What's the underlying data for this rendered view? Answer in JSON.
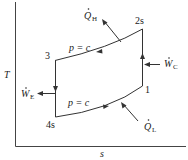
{
  "diagram": {
    "type": "T-s diagram (Brayton / gas refrigeration cycle)",
    "axes": {
      "y_label": "T",
      "x_label": "s"
    },
    "states": [
      {
        "id": "1",
        "label": "1"
      },
      {
        "id": "2s",
        "label": "2s"
      },
      {
        "id": "3",
        "label": "3"
      },
      {
        "id": "4s",
        "label": "4s"
      }
    ],
    "processes": [
      {
        "from": "1",
        "to": "2s",
        "type": "isentropic compression",
        "direction": "up"
      },
      {
        "from": "2s",
        "to": "3",
        "type": "constant pressure",
        "label": "p = c",
        "direction": "left"
      },
      {
        "from": "3",
        "to": "4s",
        "type": "isentropic expansion",
        "direction": "down"
      },
      {
        "from": "4s",
        "to": "1",
        "type": "constant pressure",
        "label": "p = c",
        "direction": "right"
      }
    ],
    "energy_flows": {
      "Q_H": {
        "symbol": "Q",
        "subscript": "H",
        "direction": "out"
      },
      "Q_L": {
        "symbol": "Q",
        "subscript": "L",
        "direction": "in"
      },
      "W_C": {
        "symbol": "W",
        "subscript": "C",
        "direction": "in"
      },
      "W_E": {
        "symbol": "W",
        "subscript": "E",
        "direction": "out"
      }
    },
    "labels": {
      "state1": "1",
      "state2s": "2s",
      "state3": "3",
      "state4s": "4s",
      "pc_top": "p = c",
      "pc_bottom": "p = c",
      "qh_sym": "Q",
      "qh_sub": "H",
      "ql_sym": "Q",
      "ql_sub": "L",
      "wc_sym": "W",
      "wc_sub": "C",
      "we_sym": "W",
      "we_sub": "E",
      "t_axis": "T",
      "s_axis": "s"
    },
    "colors": {
      "line": "#333333",
      "text": "#222222",
      "background": "#ffffff"
    }
  }
}
